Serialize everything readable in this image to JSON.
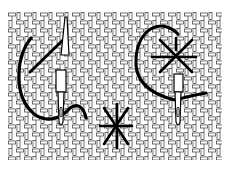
{
  "figure": {
    "canvas": {
      "x": 8,
      "y": 12,
      "width": 214,
      "height": 148,
      "cell": 8,
      "line_color": "#333333",
      "fill": "#ffffff"
    },
    "stitches": [
      {
        "name": "diagonal-stitch",
        "type": "diagonal"
      },
      {
        "name": "star-stitch-top-right",
        "type": "star"
      },
      {
        "name": "star-stitch-bottom-center",
        "type": "star"
      }
    ],
    "needles": [
      {
        "name": "needle-left"
      },
      {
        "name": "needle-right"
      }
    ],
    "caption": ""
  }
}
